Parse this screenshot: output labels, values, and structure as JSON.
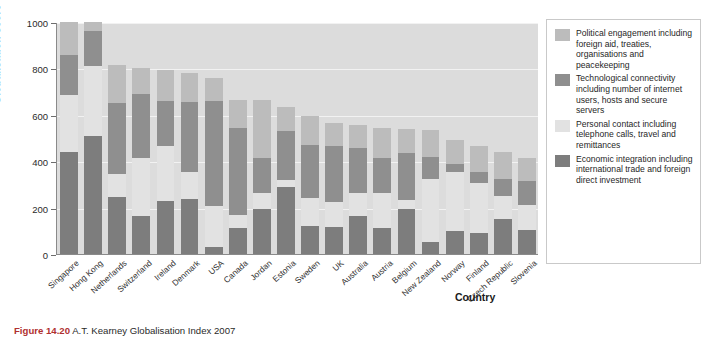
{
  "chart_data": {
    "type": "bar",
    "subtype": "stacked-bar",
    "title": "",
    "xlabel": "Country",
    "ylabel": "Globalisation score",
    "ylim": [
      0,
      1000
    ],
    "yticks": [
      0,
      200,
      400,
      600,
      800,
      1000
    ],
    "grid": true,
    "legend_position": "right",
    "categories": [
      "Singapore",
      "Hong Kong",
      "Netherlands",
      "Switzerland",
      "Ireland",
      "Denmark",
      "USA",
      "Canada",
      "Jordan",
      "Estonia",
      "Sweden",
      "UK",
      "Australia",
      "Austria",
      "Belgium",
      "New Zealand",
      "Norway",
      "Finland",
      "Czech Republic",
      "Slovenia"
    ],
    "series": [
      {
        "name": "Economic integration including international trade and foreign direct investment",
        "short": "Economic integration",
        "color": "#7d7d7d",
        "values": [
          440,
          510,
          245,
          165,
          230,
          235,
          30,
          110,
          195,
          290,
          120,
          115,
          165,
          110,
          195,
          50,
          100,
          90,
          150,
          105
        ]
      },
      {
        "name": "Personal contact including telephone calls, travel and remittances",
        "short": "Personal contact",
        "color": "#e2e2e2",
        "values": [
          245,
          300,
          100,
          250,
          235,
          120,
          175,
          60,
          70,
          30,
          120,
          110,
          100,
          155,
          40,
          275,
          255,
          215,
          100,
          105
        ]
      },
      {
        "name": "Technological connectivity including number of internet users, hosts and secure servers",
        "short": "Technological connectivity",
        "color": "#8f8f8f",
        "values": [
          175,
          150,
          305,
          275,
          195,
          300,
          455,
          375,
          150,
          210,
          230,
          240,
          190,
          150,
          200,
          95,
          35,
          50,
          75,
          105
        ]
      },
      {
        "name": "Political engagement including foreign aid, treaties, organisations and peacekeeping",
        "short": "Political engagement",
        "color": "#bcbcbc",
        "values": [
          140,
          40,
          165,
          110,
          135,
          125,
          100,
          120,
          250,
          105,
          125,
          100,
          100,
          130,
          105,
          115,
          100,
          110,
          115,
          100
        ]
      }
    ],
    "totals": [
      1000,
      1000,
      815,
      800,
      795,
      780,
      760,
      665,
      665,
      635,
      595,
      565,
      555,
      545,
      540,
      535,
      490,
      465,
      440,
      415
    ]
  },
  "axes": {
    "y_title": "Globalisation score",
    "x_title": "Country",
    "y_ticks": [
      "1000",
      "800",
      "600",
      "400",
      "200",
      "0"
    ]
  },
  "legend": {
    "items": [
      {
        "color": "#bcbcbc",
        "text": "Political engagement including foreign aid, treaties, organisations and peacekeeping"
      },
      {
        "color": "#8f8f8f",
        "text": "Technological connectivity including number of internet users, hosts and secure servers"
      },
      {
        "color": "#e2e2e2",
        "text": "Personal contact including telephone calls, travel and remittances"
      },
      {
        "color": "#7d7d7d",
        "text": "Economic integration including international trade and foreign direct investment"
      }
    ]
  },
  "caption": {
    "label": "Figure 14.20",
    "text": "A.T. Kearney Globalisation Index 2007"
  },
  "colors": {
    "plot_background": "#dcdcdc",
    "gridline": "#f2f2f2",
    "axis": "#8a8a8a",
    "caption_label": "#b03030"
  }
}
